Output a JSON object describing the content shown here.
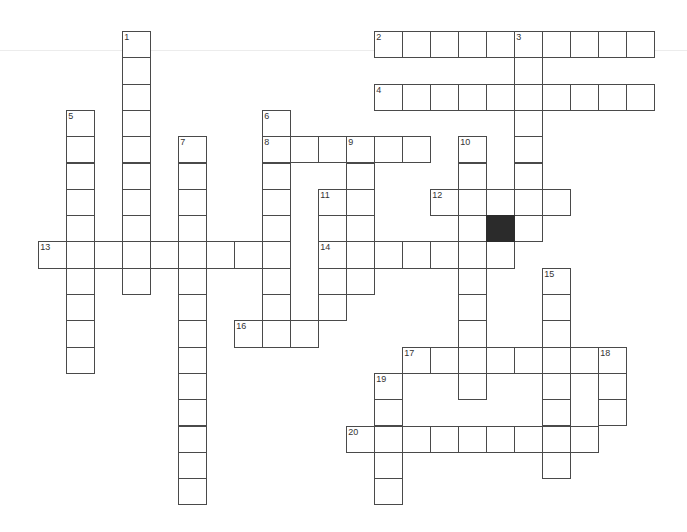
{
  "puzzle": {
    "type": "crossword",
    "grid_origin": {
      "x": 38.3,
      "y": 31
    },
    "cell_size": {
      "w": 28,
      "h": 26.3
    },
    "colors": {
      "border": "#4a4a4a",
      "fill": "#ffffff",
      "block": "#2b2b2b",
      "number": "#333333"
    },
    "words": [
      {
        "number": "1",
        "direction": "down",
        "row": 0,
        "col": 3,
        "length": 10
      },
      {
        "number": "2",
        "direction": "across",
        "row": 0,
        "col": 12,
        "length": 10
      },
      {
        "number": "3",
        "direction": "down",
        "row": 0,
        "col": 17,
        "length": 8
      },
      {
        "number": "4",
        "direction": "across",
        "row": 2,
        "col": 12,
        "length": 10
      },
      {
        "number": "5",
        "direction": "down",
        "row": 3,
        "col": 1,
        "length": 10
      },
      {
        "number": "6",
        "direction": "down",
        "row": 3,
        "col": 8,
        "length": 9
      },
      {
        "number": "7",
        "direction": "down",
        "row": 4,
        "col": 5,
        "length": 14
      },
      {
        "number": "8",
        "direction": "across",
        "row": 4,
        "col": 8,
        "length": 6
      },
      {
        "number": "9",
        "direction": "down",
        "row": 4,
        "col": 11,
        "length": 6
      },
      {
        "number": "10",
        "direction": "down",
        "row": 4,
        "col": 15,
        "length": 10
      },
      {
        "number": "11",
        "direction": "down",
        "row": 6,
        "col": 10,
        "length": 5
      },
      {
        "number": "12",
        "direction": "across",
        "row": 6,
        "col": 14,
        "length": 5
      },
      {
        "number": "13",
        "direction": "across",
        "row": 8,
        "col": 0,
        "length": 9
      },
      {
        "number": "14",
        "direction": "across",
        "row": 8,
        "col": 10,
        "length": 7
      },
      {
        "number": "15",
        "direction": "down",
        "row": 9,
        "col": 18,
        "length": 8
      },
      {
        "number": "16",
        "direction": "across",
        "row": 11,
        "col": 7,
        "length": 3
      },
      {
        "number": "17",
        "direction": "across",
        "row": 12,
        "col": 13,
        "length": 8
      },
      {
        "number": "18",
        "direction": "down",
        "row": 12,
        "col": 20,
        "length": 3
      },
      {
        "number": "19",
        "direction": "down",
        "row": 13,
        "col": 12,
        "length": 5
      },
      {
        "number": "20",
        "direction": "across",
        "row": 15,
        "col": 11,
        "length": 9
      }
    ],
    "black_cells": [
      {
        "row": 7,
        "col": 16
      }
    ]
  }
}
